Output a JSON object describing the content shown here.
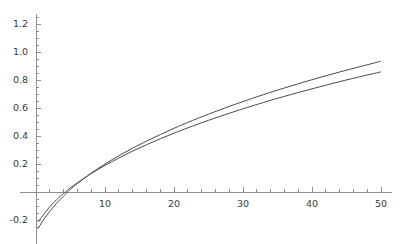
{
  "chart_data": {
    "type": "line",
    "title": "",
    "xlabel": "",
    "ylabel": "",
    "xlim": [
      0,
      51.5
    ],
    "ylim": [
      -0.28,
      1.27
    ],
    "grid": false,
    "legend": "none",
    "x_ticks_major": [
      10,
      20,
      30,
      40,
      50
    ],
    "x_tick_labels": [
      "10",
      "20",
      "30",
      "40",
      "50"
    ],
    "x_ticks_minor_step": 2,
    "y_ticks_major": [
      -0.2,
      0.2,
      0.4,
      0.6,
      0.8,
      1.0,
      1.2
    ],
    "y_tick_labels": [
      "-0.2",
      "0.2",
      "0.4",
      "0.6",
      "0.8",
      "1.0",
      "1.2"
    ],
    "y_ticks_minor_step": 0.05,
    "axis_color": "#8d8d8d",
    "curve_color": "#4a4a4a",
    "background": "#ffffff",
    "series": [
      {
        "name": "upper",
        "x": [
          0.3,
          1,
          2,
          3,
          3.5,
          4,
          5,
          6,
          8,
          10,
          12,
          14,
          16,
          18,
          20,
          22,
          25,
          28,
          30,
          33,
          36,
          40,
          44,
          47,
          50
        ],
        "values": [
          -0.213,
          -0.168,
          -0.105,
          -0.054,
          -0.031,
          -0.01,
          0.03,
          0.066,
          0.132,
          0.19,
          0.243,
          0.292,
          0.337,
          0.38,
          0.42,
          0.458,
          0.512,
          0.562,
          0.594,
          0.64,
          0.683,
          0.737,
          0.788,
          0.824,
          0.858
        ]
      },
      {
        "name": "lower",
        "x": [
          0.3,
          1,
          2,
          3,
          4,
          4.2,
          5,
          6,
          8,
          10,
          12,
          14,
          16,
          18,
          20,
          22,
          25,
          28,
          30,
          33,
          36,
          40,
          44,
          47,
          50
        ],
        "values": [
          -0.262,
          -0.205,
          -0.138,
          -0.08,
          -0.03,
          -0.02,
          0.02,
          0.06,
          0.135,
          0.2,
          0.259,
          0.313,
          0.363,
          0.41,
          0.455,
          0.497,
          0.556,
          0.611,
          0.646,
          0.696,
          0.743,
          0.802,
          0.857,
          0.896,
          0.934
        ]
      }
    ]
  },
  "axes": {
    "origin_x_px": 36,
    "origin_y_px": 192,
    "x_scale_px_per_unit": 6.9,
    "y_scale_px_per_unit": 140
  }
}
